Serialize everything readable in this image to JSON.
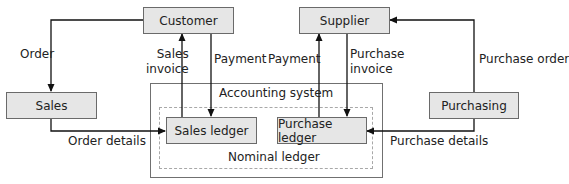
{
  "diagram": {
    "nodes": {
      "customer": "Customer",
      "supplier": "Supplier",
      "sales": "Sales",
      "purchasing": "Purchasing",
      "sales_ledger": "Sales ledger",
      "purchase_ledger": "Purchase ledger"
    },
    "containers": {
      "accounting_system": "Accounting system",
      "nominal_ledger": "Nominal ledger"
    },
    "edges": {
      "order": "Order",
      "sales_invoice_line1": "Sales",
      "sales_invoice_line2": "invoice",
      "customer_payment": "Payment",
      "supplier_payment": "Payment",
      "purchase_invoice_line1": "Purchase",
      "purchase_invoice_line2": "invoice",
      "purchase_order": "Purchase order",
      "order_details": "Order details",
      "purchase_details": "Purchase details"
    }
  }
}
